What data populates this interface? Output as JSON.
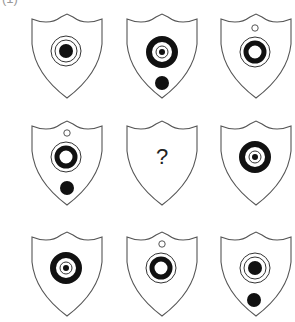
{
  "puzzle": {
    "label": "(1)",
    "question_mark": "?",
    "stroke_color": "#555555",
    "fill_color": "#111111",
    "cells": [
      {
        "row": 0,
        "col": 0,
        "x": 33,
        "y": 14,
        "small_hollow_top": false,
        "center": "solid-dot-in-two-thin-rings",
        "bottom_dot": false
      },
      {
        "row": 0,
        "col": 1,
        "x": 128,
        "y": 14,
        "small_hollow_top": false,
        "center": "small-dot-thin-ring-in-thick-ring",
        "bottom_dot": true
      },
      {
        "row": 0,
        "col": 2,
        "x": 222,
        "y": 14,
        "small_hollow_top": true,
        "center": "thick-ring-in-thin-ring",
        "bottom_dot": false
      },
      {
        "row": 1,
        "col": 0,
        "x": 33,
        "y": 121,
        "small_hollow_top": true,
        "center": "thick-ring-in-thin-ring",
        "bottom_dot": true
      },
      {
        "row": 1,
        "col": 1,
        "x": 128,
        "y": 121,
        "question": true
      },
      {
        "row": 1,
        "col": 2,
        "x": 222,
        "y": 121,
        "small_hollow_top": false,
        "center": "small-dot-thin-ring-in-thick-ring",
        "bottom_dot": false
      },
      {
        "row": 2,
        "col": 0,
        "x": 33,
        "y": 232,
        "small_hollow_top": false,
        "center": "small-dot-thin-ring-in-thick-ring",
        "bottom_dot": false
      },
      {
        "row": 2,
        "col": 1,
        "x": 128,
        "y": 232,
        "small_hollow_top": true,
        "center": "thick-ring-in-thin-ring",
        "bottom_dot": false
      },
      {
        "row": 2,
        "col": 2,
        "x": 222,
        "y": 232,
        "small_hollow_top": false,
        "center": "solid-dot-in-two-thin-rings",
        "bottom_dot": true
      }
    ]
  }
}
